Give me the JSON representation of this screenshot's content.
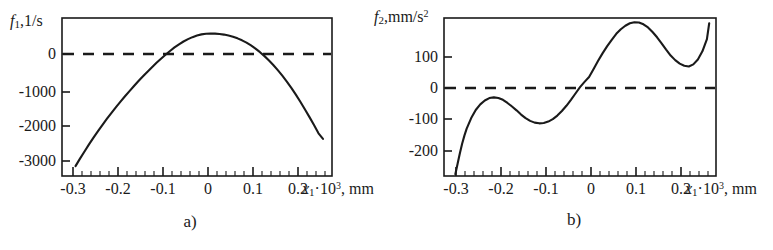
{
  "figure": {
    "panels": [
      {
        "caption": "a)",
        "ylabel": {
          "fn": "f",
          "sub": "1",
          "units": ",1/s"
        },
        "xlabel": {
          "var": "x",
          "sub": "1",
          "mult": "·10",
          "sup": "3",
          "units": ", mm"
        },
        "yticks": [
          "0",
          "-1000",
          "-2000",
          "-3000"
        ],
        "xticks": [
          "-0.3",
          "-0.2",
          "-0.1",
          "0",
          "0.1",
          "0.2"
        ]
      },
      {
        "caption": "b)",
        "ylabel": {
          "fn": "f",
          "sub": "2",
          "units": ",mm/s",
          "sup": "2"
        },
        "xlabel": {
          "var": "x",
          "sub": "1",
          "mult": "·10",
          "sup": "3",
          "units": ", mm"
        },
        "yticks": [
          "100",
          "0",
          "-100",
          "-200"
        ],
        "xticks": [
          "-0.3",
          "-0.2",
          "-0.1",
          "0",
          "0.1",
          "0.2"
        ]
      }
    ]
  },
  "chart_data": [
    {
      "type": "line",
      "title": "",
      "panel_label": "a)",
      "xlabel": "x1·10^3, mm",
      "ylabel": "f1, 1/s",
      "xlim": [
        -0.32,
        0.28
      ],
      "ylim": [
        -3500,
        500
      ],
      "yticks": [
        0,
        -1000,
        -2000,
        -3000
      ],
      "xticks": [
        -0.3,
        -0.2,
        -0.1,
        0,
        0.1,
        0.2
      ],
      "grid": false,
      "legend": null,
      "series": [
        {
          "name": "f1",
          "style": "solid",
          "x": [
            -0.29,
            -0.28,
            -0.27,
            -0.26,
            -0.25,
            -0.24,
            -0.23,
            -0.22,
            -0.21,
            -0.2,
            -0.19,
            -0.18,
            -0.17,
            -0.16,
            -0.15,
            -0.14,
            -0.13,
            -0.12,
            -0.11,
            -0.1,
            -0.09,
            -0.08,
            -0.07,
            -0.06,
            -0.05,
            -0.04,
            -0.03,
            -0.02,
            -0.01,
            0.0,
            0.01,
            0.02,
            0.03,
            0.04,
            0.05,
            0.06,
            0.07,
            0.08,
            0.09,
            0.1,
            0.11,
            0.12,
            0.13,
            0.14,
            0.15,
            0.16,
            0.17,
            0.18,
            0.19,
            0.2,
            0.21,
            0.22,
            0.23,
            0.24,
            0.25,
            0.26
          ],
          "y": [
            -3250,
            -3060,
            -2880,
            -2700,
            -2530,
            -2365,
            -2205,
            -2050,
            -1900,
            -1755,
            -1615,
            -1480,
            -1350,
            -1220,
            -1095,
            -975,
            -860,
            -745,
            -635,
            -530,
            -430,
            -335,
            -245,
            -165,
            -95,
            -35,
            15,
            55,
            85,
            100,
            108,
            105,
            95,
            80,
            55,
            25,
            -15,
            -65,
            -125,
            -195,
            -275,
            -365,
            -465,
            -575,
            -695,
            -825,
            -965,
            -1115,
            -1275,
            -1445,
            -1625,
            -1815,
            -2010,
            -2210,
            -2420,
            -2560
          ]
        },
        {
          "name": "zero-reference",
          "style": "dashed",
          "x": [
            -0.32,
            0.28
          ],
          "y": [
            0,
            0
          ]
        }
      ],
      "annotations": {
        "zero_crossings": [
          -0.13,
          0.145
        ],
        "maximum": {
          "x": 0.005,
          "y": 108
        }
      }
    },
    {
      "type": "line",
      "title": "",
      "panel_label": "b)",
      "xlabel": "x1·10^3, mm",
      "ylabel": "f2, mm/s^2",
      "xlim": [
        -0.32,
        0.28
      ],
      "ylim": [
        -260,
        190
      ],
      "yticks": [
        100,
        0,
        -100,
        -200
      ],
      "xticks": [
        -0.3,
        -0.2,
        -0.1,
        0,
        0.1,
        0.2
      ],
      "grid": false,
      "legend": null,
      "series": [
        {
          "name": "f2",
          "style": "solid",
          "x": [
            -0.295,
            -0.29,
            -0.285,
            -0.28,
            -0.275,
            -0.27,
            -0.26,
            -0.25,
            -0.24,
            -0.23,
            -0.22,
            -0.21,
            -0.2,
            -0.19,
            -0.18,
            -0.17,
            -0.16,
            -0.15,
            -0.14,
            -0.13,
            -0.12,
            -0.11,
            -0.1,
            -0.09,
            -0.08,
            -0.07,
            -0.06,
            -0.05,
            -0.04,
            -0.03,
            -0.02,
            -0.01,
            0.0,
            0.01,
            0.02,
            0.03,
            0.04,
            0.05,
            0.06,
            0.07,
            0.08,
            0.09,
            0.1,
            0.11,
            0.12,
            0.13,
            0.14,
            0.15,
            0.16,
            0.17,
            0.18,
            0.19,
            0.2,
            0.21,
            0.22,
            0.23,
            0.24,
            0.25,
            0.26,
            0.265
          ],
          "y": [
            -255,
            -225,
            -195,
            -168,
            -145,
            -125,
            -95,
            -72,
            -56,
            -45,
            -38,
            -36,
            -38,
            -43,
            -52,
            -62,
            -73,
            -85,
            -95,
            -103,
            -108,
            -110,
            -109,
            -105,
            -98,
            -88,
            -75,
            -60,
            -43,
            -25,
            -7,
            8,
            22,
            45,
            68,
            90,
            110,
            128,
            145,
            158,
            168,
            175,
            178,
            177,
            172,
            163,
            150,
            135,
            118,
            100,
            83,
            70,
            60,
            54,
            52,
            58,
            72,
            95,
            130,
            175
          ]
        },
        {
          "name": "zero-reference",
          "style": "dashed",
          "x": [
            -0.32,
            0.28
          ],
          "y": [
            0,
            0
          ]
        }
      ],
      "annotations": {
        "local_max_left": {
          "x": -0.215,
          "y": -36
        },
        "local_min_left": {
          "x": -0.11,
          "y": -110
        },
        "global_max": {
          "x": 0.1,
          "y": 178
        },
        "local_min_right": {
          "x": 0.22,
          "y": 52
        },
        "zero_crossing": -0.012
      }
    }
  ]
}
